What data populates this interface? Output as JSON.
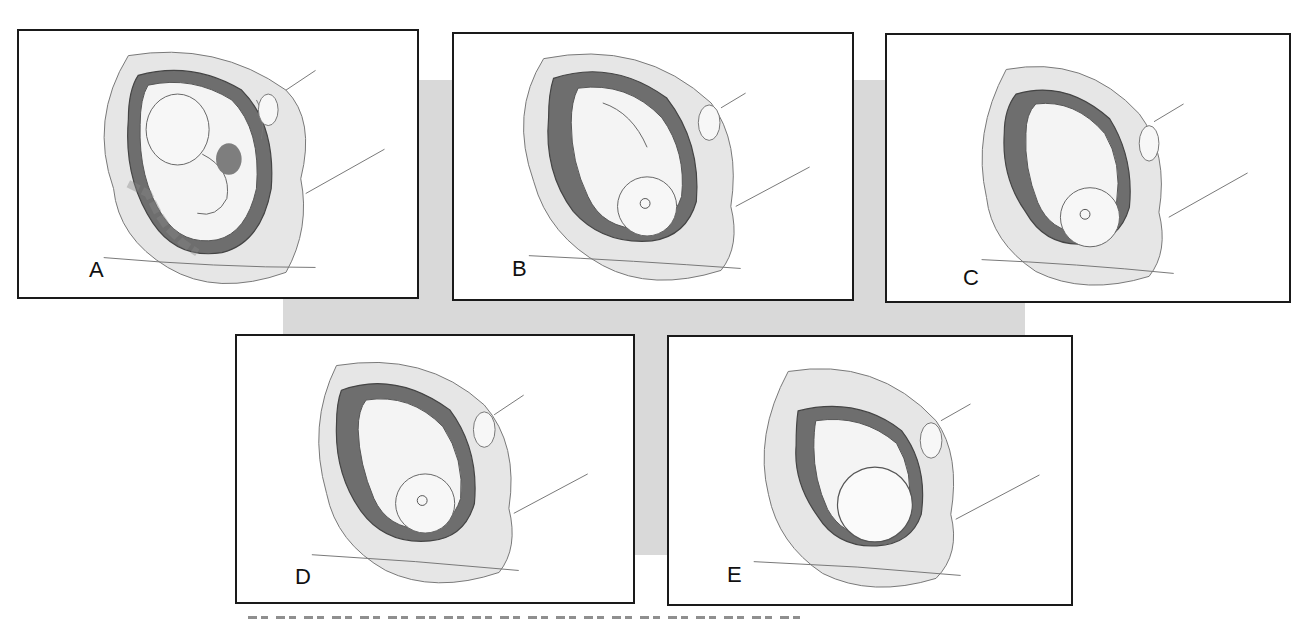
{
  "figure": {
    "background_color": "#d9d9d9",
    "panels": [
      {
        "id": "A",
        "label": "A",
        "fetal_position": "fetus facing forward, head up, hands at face, placenta visible (abdomen view)"
      },
      {
        "id": "B",
        "label": "B",
        "fetal_position": "vertex, head down, back toward mother's right"
      },
      {
        "id": "C",
        "label": "C",
        "fetal_position": "vertex, head engaged lower in pelvis"
      },
      {
        "id": "D",
        "label": "D",
        "fetal_position": "vertex, head down, flexed limbs"
      },
      {
        "id": "E",
        "label": "E",
        "fetal_position": "head down, viewed from crown (occiput)"
      }
    ],
    "caption_visible": false
  },
  "colors": {
    "panel_border": "#1a1a1a",
    "tissue_light": "#e6e6e6",
    "tissue_mid": "#bdbdbd",
    "amniotic_dark": "#6e6e6e",
    "outline": "#555555"
  }
}
